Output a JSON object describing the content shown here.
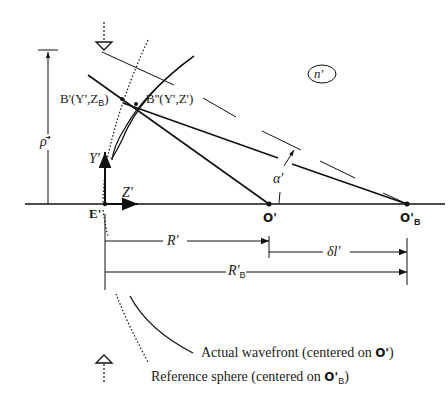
{
  "diagram": {
    "medium_label": "n'",
    "points": {
      "E": "E'",
      "O": "O'",
      "OB_main": "O'",
      "OB_sub": "B",
      "B_ref": "B'(Y',Z",
      "B_ref_sub": "B",
      "B_ref_close": ")",
      "B_act": "B''(Y',Z')"
    },
    "axes": {
      "y_label": "Y'",
      "z_label": "Z'"
    },
    "dimensions": {
      "rho": "ρ̄'",
      "R": "R'",
      "delta_l": "δl'",
      "RB_main": "R'",
      "RB_sub": "B",
      "alpha": "α'"
    },
    "captions": {
      "actual_wavefront_prefix": "Actual wavefront (centered on ",
      "actual_wavefront_point": "O'",
      "actual_wavefront_suffix": ")",
      "reference_sphere_prefix": "Reference sphere (centered on ",
      "reference_sphere_point": "O'",
      "reference_sphere_point_sub": "B",
      "reference_sphere_suffix": ")"
    }
  }
}
